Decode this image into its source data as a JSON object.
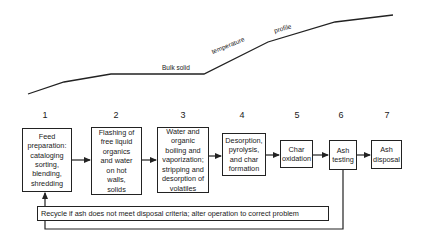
{
  "profile": {
    "labels": [
      "Bulk solid",
      "temperature",
      "profile"
    ],
    "points": [
      [
        28,
        94
      ],
      [
        64,
        82
      ],
      [
        111,
        74
      ],
      [
        204,
        74
      ],
      [
        268,
        42
      ],
      [
        335,
        22
      ],
      [
        393,
        15
      ]
    ]
  },
  "steps": [
    {
      "number": "1",
      "text": "Feed\npreparation:\ncataloging\nsorting,\nblending,\nshredding"
    },
    {
      "number": "2",
      "text": "Flashing of\nfree liquid\norganics\nand water\non hot\nwalls,\nsolids"
    },
    {
      "number": "3",
      "text": "Water and\norganic\nboiling and\nvaporization;\nstripping and\ndesorption of\nvolatiles"
    },
    {
      "number": "4",
      "text": "Desorption,\npyrolysis,\nand char\nformation"
    },
    {
      "number": "5",
      "text": "Char\noxidation"
    },
    {
      "number": "6",
      "text": "Ash\ntesting"
    },
    {
      "number": "7",
      "text": "Ash\ndisposal"
    }
  ],
  "recycle": {
    "text": "Recycle if ash does not meet disposal criteria; alter operation to correct problem"
  },
  "colors": {
    "line": "#222222",
    "background": "#ffffff"
  }
}
